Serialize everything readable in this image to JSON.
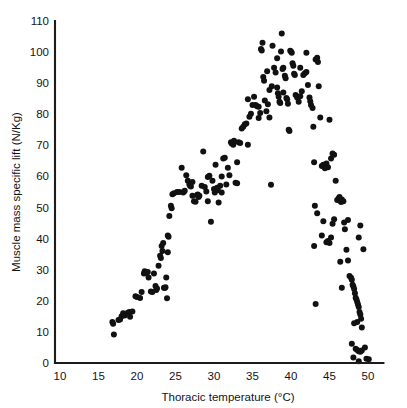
{
  "chart_data": {
    "type": "scatter",
    "title": "",
    "xlabel": "Thoracic temperature (°C)",
    "ylabel": "Muscle mass specific lift (N/Kg)",
    "xlim": [
      10,
      52
    ],
    "ylim": [
      0,
      110
    ],
    "xticks": [
      10,
      15,
      20,
      25,
      30,
      35,
      40,
      45,
      50
    ],
    "yticks": [
      0,
      10,
      20,
      30,
      40,
      50,
      60,
      70,
      80,
      90,
      100,
      110
    ],
    "xtick_labels": [
      "10",
      "15",
      "20",
      "25",
      "30",
      "35",
      "40",
      "45",
      "50"
    ],
    "ytick_labels": [
      "0",
      "10",
      "20",
      "30",
      "40",
      "50",
      "60",
      "70",
      "80",
      "90",
      "100",
      "110"
    ],
    "grid": false,
    "legend": null,
    "marker": "filled-circle",
    "marker_color": "#111111",
    "marker_size_px": 4.2,
    "series": [
      {
        "name": "Muscle mass specific lift",
        "points": [
          [
            16.8,
            13.2
          ],
          [
            16.9,
            12.6
          ],
          [
            17.0,
            9.2
          ],
          [
            17.6,
            13.8
          ],
          [
            18.0,
            15.0
          ],
          [
            18.2,
            16.0
          ],
          [
            18.4,
            15.3
          ],
          [
            18.8,
            16.2
          ],
          [
            19.0,
            16.4
          ],
          [
            19.1,
            14.9
          ],
          [
            19.8,
            21.5
          ],
          [
            20.0,
            21.2
          ],
          [
            20.4,
            20.9
          ],
          [
            20.9,
            28.8
          ],
          [
            21.0,
            29.5
          ],
          [
            21.2,
            28.9
          ],
          [
            21.4,
            29.3
          ],
          [
            21.5,
            27.5
          ],
          [
            21.8,
            23.0
          ],
          [
            22.0,
            22.8
          ],
          [
            22.2,
            28.8
          ],
          [
            22.5,
            23.5
          ],
          [
            22.6,
            24.0
          ],
          [
            22.8,
            31.3
          ],
          [
            23.0,
            34.5
          ],
          [
            23.1,
            33.8
          ],
          [
            23.2,
            37.6
          ],
          [
            23.3,
            36.0
          ],
          [
            23.4,
            38.6
          ],
          [
            23.5,
            24.2
          ],
          [
            23.6,
            24.1
          ],
          [
            23.7,
            24.4
          ],
          [
            23.8,
            27.5
          ],
          [
            23.9,
            20.8
          ],
          [
            24.0,
            41.0
          ],
          [
            24.1,
            40.6
          ],
          [
            24.2,
            47.3
          ],
          [
            24.4,
            50.6
          ],
          [
            24.5,
            49.8
          ],
          [
            24.6,
            54.3
          ],
          [
            24.8,
            54.6
          ],
          [
            25.5,
            55.0
          ],
          [
            25.8,
            62.8
          ],
          [
            26.0,
            54.8
          ],
          [
            26.1,
            55.2
          ],
          [
            26.2,
            55.4
          ],
          [
            26.4,
            60.4
          ],
          [
            26.6,
            58.6
          ],
          [
            26.8,
            57.4
          ],
          [
            26.9,
            57.0
          ],
          [
            27.0,
            56.8
          ],
          [
            27.2,
            53.8
          ],
          [
            27.4,
            52.0
          ],
          [
            27.6,
            51.9
          ],
          [
            27.8,
            54.0
          ],
          [
            27.9,
            54.2
          ],
          [
            28.0,
            53.4
          ],
          [
            28.1,
            53.8
          ],
          [
            28.4,
            57.0
          ],
          [
            28.6,
            68.0
          ],
          [
            28.8,
            56.6
          ],
          [
            29.0,
            55.2
          ],
          [
            29.2,
            59.8
          ],
          [
            29.4,
            60.2
          ],
          [
            29.6,
            45.4
          ],
          [
            29.8,
            58.6
          ],
          [
            30.0,
            56.0
          ],
          [
            30.1,
            54.8
          ],
          [
            30.2,
            63.8
          ],
          [
            30.4,
            56.4
          ],
          [
            30.5,
            55.6
          ],
          [
            30.6,
            51.6
          ],
          [
            30.8,
            57.0
          ],
          [
            31.0,
            54.8
          ],
          [
            31.2,
            65.8
          ],
          [
            31.4,
            66.0
          ],
          [
            31.6,
            57.4
          ],
          [
            31.8,
            62.8
          ],
          [
            32.0,
            60.4
          ],
          [
            32.2,
            71.0
          ],
          [
            32.3,
            70.6
          ],
          [
            32.5,
            70.2
          ],
          [
            32.6,
            71.5
          ],
          [
            32.8,
            58.0
          ],
          [
            33.0,
            57.8
          ],
          [
            33.2,
            71.0
          ],
          [
            33.4,
            70.8
          ],
          [
            33.6,
            75.4
          ],
          [
            33.8,
            76.0
          ],
          [
            34.0,
            76.8
          ],
          [
            34.2,
            77.0
          ],
          [
            34.4,
            70.2
          ],
          [
            34.6,
            79.2
          ],
          [
            34.8,
            80.2
          ],
          [
            35.0,
            83.0
          ],
          [
            35.2,
            85.6
          ],
          [
            35.4,
            83.0
          ],
          [
            35.6,
            82.6
          ],
          [
            35.8,
            82.4
          ],
          [
            36.0,
            80.4
          ],
          [
            36.1,
            101.0
          ],
          [
            36.2,
            100.5
          ],
          [
            36.3,
            103.0
          ],
          [
            36.4,
            92.0
          ],
          [
            36.5,
            90.8
          ],
          [
            36.6,
            84.4
          ],
          [
            36.8,
            81.0
          ],
          [
            37.0,
            83.2
          ],
          [
            37.2,
            79.0
          ],
          [
            37.4,
            57.3
          ],
          [
            37.5,
            89.0
          ],
          [
            37.6,
            102.0
          ],
          [
            37.8,
            95.0
          ],
          [
            38.0,
            93.4
          ],
          [
            38.2,
            88.6
          ],
          [
            38.3,
            86.8
          ],
          [
            38.4,
            85.6
          ],
          [
            38.5,
            84.0
          ],
          [
            38.6,
            83.6
          ],
          [
            38.7,
            100.2
          ],
          [
            38.8,
            106.0
          ],
          [
            38.9,
            94.6
          ],
          [
            39.0,
            95.0
          ],
          [
            39.2,
            92.4
          ],
          [
            39.3,
            91.6
          ],
          [
            39.4,
            85.2
          ],
          [
            39.5,
            84.8
          ],
          [
            39.6,
            83.4
          ],
          [
            39.7,
            75.0
          ],
          [
            39.8,
            74.6
          ],
          [
            39.9,
            100.4
          ],
          [
            40.0,
            100.2
          ],
          [
            40.1,
            99.8
          ],
          [
            40.2,
            96.4
          ],
          [
            40.3,
            95.6
          ],
          [
            40.4,
            93.0
          ],
          [
            40.5,
            92.6
          ],
          [
            40.6,
            86.2
          ],
          [
            40.8,
            85.4
          ],
          [
            41.0,
            84.0
          ],
          [
            41.2,
            85.8
          ],
          [
            41.4,
            87.4
          ],
          [
            41.6,
            92.6
          ],
          [
            41.8,
            93.2
          ],
          [
            42.0,
            99.8
          ],
          [
            42.2,
            89.4
          ],
          [
            42.4,
            85.4
          ],
          [
            42.5,
            84.2
          ],
          [
            42.6,
            83.0
          ],
          [
            42.8,
            82.0
          ],
          [
            42.9,
            76.0
          ],
          [
            43.0,
            64.6
          ],
          [
            43.2,
            97.6
          ],
          [
            43.4,
            98.2
          ],
          [
            43.5,
            96.8
          ],
          [
            43.6,
            89.0
          ],
          [
            43.8,
            79.0
          ],
          [
            44.0,
            63.4
          ],
          [
            44.2,
            63.8
          ],
          [
            44.4,
            62.6
          ],
          [
            43.1,
            50.6
          ],
          [
            43.4,
            48.2
          ],
          [
            43.0,
            37.6
          ],
          [
            43.2,
            19.0
          ],
          [
            44.0,
            41.0
          ],
          [
            44.2,
            45.6
          ],
          [
            44.6,
            64.2
          ],
          [
            44.8,
            63.0
          ],
          [
            45.0,
            78.2
          ],
          [
            45.2,
            65.8
          ],
          [
            45.4,
            67.4
          ],
          [
            45.6,
            67.0
          ],
          [
            44.6,
            38.8
          ],
          [
            44.8,
            39.2
          ],
          [
            45.0,
            38.6
          ],
          [
            45.2,
            40.4
          ],
          [
            45.4,
            44.8
          ],
          [
            45.6,
            46.2
          ],
          [
            45.8,
            58.6
          ],
          [
            46.0,
            52.4
          ],
          [
            46.2,
            53.0
          ],
          [
            46.3,
            53.4
          ],
          [
            46.4,
            52.2
          ],
          [
            46.5,
            51.8
          ],
          [
            46.6,
            52.6
          ],
          [
            46.8,
            52.0
          ],
          [
            46.9,
            45.2
          ],
          [
            47.0,
            43.0
          ],
          [
            46.4,
            32.6
          ],
          [
            46.6,
            24.2
          ],
          [
            47.2,
            36.4
          ],
          [
            47.4,
            33.0
          ],
          [
            47.6,
            28.0
          ],
          [
            47.8,
            27.4
          ],
          [
            47.9,
            26.8
          ],
          [
            48.0,
            25.2
          ],
          [
            48.1,
            24.6
          ],
          [
            48.2,
            23.8
          ],
          [
            48.3,
            22.4
          ],
          [
            48.4,
            21.0
          ],
          [
            48.5,
            20.4
          ],
          [
            48.6,
            19.6
          ],
          [
            48.7,
            18.8
          ],
          [
            48.8,
            18.0
          ],
          [
            48.9,
            16.4
          ],
          [
            49.0,
            15.6
          ],
          [
            49.1,
            14.2
          ],
          [
            48.6,
            13.2
          ],
          [
            48.2,
            12.8
          ],
          [
            49.2,
            11.4
          ],
          [
            47.9,
            6.2
          ],
          [
            48.4,
            4.6
          ],
          [
            48.6,
            4.2
          ],
          [
            48.8,
            3.8
          ],
          [
            49.0,
            3.6
          ],
          [
            49.2,
            4.0
          ],
          [
            48.1,
            1.8
          ],
          [
            48.8,
            0.6
          ],
          [
            49.8,
            1.4
          ],
          [
            50.1,
            1.2
          ],
          [
            49.4,
            36.6
          ],
          [
            49.0,
            44.2
          ],
          [
            48.8,
            40.4
          ],
          [
            47.4,
            46.0
          ],
          [
            49.6,
            5.0
          ],
          [
            41.2,
            95.0
          ],
          [
            42.0,
            93.6
          ],
          [
            36.9,
            93.8
          ],
          [
            38.2,
            98.0
          ],
          [
            39.0,
            87.0
          ],
          [
            37.2,
            87.8
          ],
          [
            35.8,
            78.8
          ],
          [
            34.4,
            84.8
          ],
          [
            33.0,
            64.6
          ],
          [
            31.0,
            60.0
          ],
          [
            29.2,
            52.0
          ],
          [
            27.2,
            58.2
          ],
          [
            25.2,
            55.0
          ],
          [
            24.0,
            35.6
          ],
          [
            22.4,
            24.8
          ],
          [
            20.6,
            22.8
          ],
          [
            19.4,
            16.6
          ],
          [
            17.8,
            14.0
          ]
        ]
      }
    ]
  },
  "axes": {
    "x_title": "Thoracic temperature (°C)",
    "y_title": "Muscle mass specific lift (N/Kg)"
  }
}
